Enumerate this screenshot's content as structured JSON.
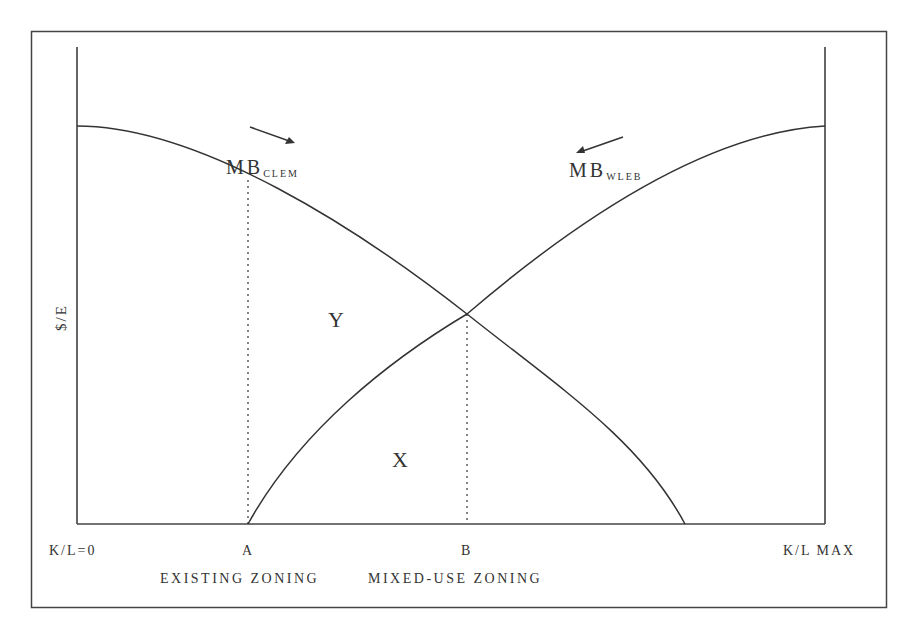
{
  "diagram": {
    "y_axis_label": "$/E",
    "x_tick_labels": {
      "origin": "K/L=0",
      "a": "A",
      "b": "B",
      "max": "K/L MAX"
    },
    "zone_labels": {
      "existing": "EXISTING ZONING",
      "mixed": "MIXED-USE ZONING"
    },
    "curves": {
      "clem": {
        "main": "MB",
        "sub": "CLEM",
        "direction": "shifting right"
      },
      "wleb": {
        "main": "MB",
        "sub": "WLEB",
        "direction": "shifting left"
      }
    },
    "regions": {
      "y": "Y",
      "x": "X"
    },
    "colors": {
      "line": "#333333",
      "background": "#ffffff"
    }
  }
}
